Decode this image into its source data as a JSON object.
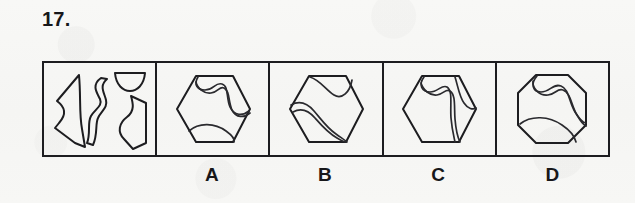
{
  "question": {
    "number": "17.",
    "type": "spatial-reasoning-shape-assembly"
  },
  "prompt_panel": {
    "name": "pieces-panel",
    "description": "Four separated puzzle pieces to be assembled",
    "pieces": [
      {
        "id": "piece-1",
        "shape": "curved-crescent-wedge",
        "position": "left"
      },
      {
        "id": "piece-2",
        "shape": "wavy-s-strip",
        "position": "center"
      },
      {
        "id": "piece-3",
        "shape": "small-bowl-semicircle",
        "position": "top-right"
      },
      {
        "id": "piece-4",
        "shape": "angular-concave-block",
        "position": "bottom-right"
      }
    ]
  },
  "options": [
    {
      "label": "A",
      "name": "option-a",
      "outline": "hexagon",
      "description": "Hexagon divided by an S-curve band with a curved arc piece at the bottom"
    },
    {
      "label": "B",
      "name": "option-b",
      "outline": "hexagon",
      "description": "Hexagon with a bowl shape at the top and a wavy diagonal band crossing to bottom-right"
    },
    {
      "label": "C",
      "name": "option-c",
      "outline": "hexagon",
      "description": "Hexagon with a vertical S-curve band and a crescent sliver on the right edge"
    },
    {
      "label": "D",
      "name": "option-d",
      "outline": "octagon",
      "description": "Octagon with an S-curve band across the middle and an arc piece at the bottom"
    }
  ],
  "colors": {
    "paper": "#f7f7f5",
    "ink": "#1d1d20",
    "text": "#17171a"
  }
}
